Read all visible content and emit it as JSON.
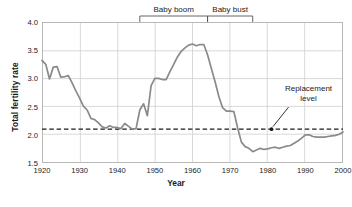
{
  "chart_data": {
    "type": "line",
    "title": "",
    "xlabel": "Year",
    "ylabel": "Total fertility rate",
    "xlim": [
      1920,
      2000
    ],
    "ylim": [
      1.5,
      4.0
    ],
    "ytick_labels": [
      "4.0",
      "3.5",
      "3.0",
      "2.5",
      "2.0",
      "1.5"
    ],
    "ytick_values": [
      4.0,
      3.5,
      3.0,
      2.5,
      2.0,
      1.5
    ],
    "xtick_labels": [
      "1920",
      "1930",
      "1940",
      "1950",
      "1960",
      "1970",
      "1980",
      "1990",
      "2000"
    ],
    "xtick_values": [
      1920,
      1930,
      1940,
      1950,
      1960,
      1970,
      1980,
      1990,
      2000
    ],
    "grid": true,
    "legend": "none",
    "line_color": "#8a8a8a",
    "grid_color": "#cfcfcf",
    "frame_color": "#b8b8b8",
    "series": [
      {
        "name": "Total fertility rate",
        "x": [
          1920,
          1921,
          1922,
          1923,
          1924,
          1925,
          1926,
          1927,
          1928,
          1929,
          1930,
          1931,
          1932,
          1933,
          1934,
          1935,
          1936,
          1937,
          1938,
          1939,
          1940,
          1941,
          1942,
          1943,
          1944,
          1945,
          1946,
          1947,
          1948,
          1949,
          1950,
          1951,
          1952,
          1953,
          1954,
          1955,
          1956,
          1957,
          1958,
          1959,
          1960,
          1961,
          1962,
          1963,
          1964,
          1965,
          1966,
          1967,
          1968,
          1969,
          1970,
          1971,
          1972,
          1973,
          1974,
          1975,
          1976,
          1977,
          1978,
          1979,
          1980,
          1981,
          1982,
          1983,
          1984,
          1985,
          1986,
          1987,
          1988,
          1989,
          1990,
          1991,
          1992,
          1993,
          1994,
          1995,
          1996,
          1997,
          1998,
          1999,
          2000
        ],
        "y": [
          3.32,
          3.25,
          2.99,
          3.2,
          3.21,
          3.02,
          3.03,
          3.05,
          2.92,
          2.78,
          2.65,
          2.51,
          2.44,
          2.29,
          2.27,
          2.21,
          2.14,
          2.12,
          2.16,
          2.13,
          2.13,
          2.11,
          2.2,
          2.15,
          2.1,
          2.11,
          2.44,
          2.55,
          2.34,
          2.87,
          3.0,
          3.0,
          2.98,
          2.98,
          3.12,
          3.25,
          3.38,
          3.48,
          3.54,
          3.59,
          3.61,
          3.58,
          3.6,
          3.6,
          3.42,
          3.18,
          2.94,
          2.68,
          2.48,
          2.42,
          2.42,
          2.41,
          2.12,
          1.87,
          1.79,
          1.76,
          1.7,
          1.73,
          1.76,
          1.74,
          1.75,
          1.77,
          1.78,
          1.76,
          1.78,
          1.8,
          1.81,
          1.85,
          1.89,
          1.94,
          2.0,
          2.0,
          1.97,
          1.96,
          1.96,
          1.96,
          1.97,
          1.98,
          1.99,
          2.01,
          2.05
        ]
      }
    ],
    "reference_line": {
      "label": "Replacement level",
      "value": 2.1,
      "style": "dashed",
      "color": "#1a1a1a",
      "marker_year": 1981
    },
    "span_annotations": [
      {
        "label": "Baby boom",
        "start": 1946,
        "end": 1964
      },
      {
        "label": "Baby bust",
        "start": 1964,
        "end": 1976
      }
    ]
  },
  "annotations": {
    "baby_boom_label": "Baby boom",
    "baby_bust_label": "Baby bust",
    "replacement_line1": "Replacement",
    "replacement_line2": "level"
  }
}
